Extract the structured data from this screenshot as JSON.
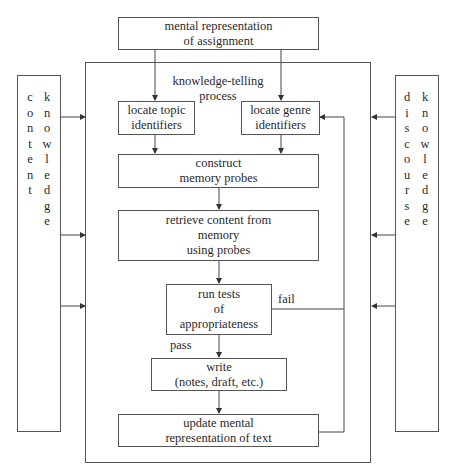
{
  "diagram": {
    "title_box": {
      "line1": "mental representation",
      "line2": "of assignment"
    },
    "process_label": {
      "line1": "knowledge-telling",
      "line2": "process"
    },
    "nodes": {
      "locate_topic": {
        "line1": "locate topic",
        "line2": "identifiers"
      },
      "locate_genre": {
        "line1": "locate genre",
        "line2": "identifiers"
      },
      "construct": {
        "line1": "construct",
        "line2": "memory probes"
      },
      "retrieve": {
        "line1": "retrieve content from",
        "line2": "memory",
        "line3": "using probes"
      },
      "run_tests": {
        "line1": "run tests",
        "line2": "of",
        "line3": "appropriateness"
      },
      "write": {
        "line1": "write",
        "line2": "(notes, draft, etc.)"
      },
      "update": {
        "line1": "update mental",
        "line2": "representation of text"
      }
    },
    "edge_labels": {
      "fail": "fail",
      "pass": "pass"
    },
    "left_side": {
      "col1": [
        "c",
        "o",
        "n",
        "t",
        "e",
        "n",
        "t"
      ],
      "col2": [
        "k",
        "n",
        "o",
        "w",
        "l",
        "e",
        "d",
        "g",
        "e"
      ]
    },
    "right_side": {
      "col1": [
        "d",
        "i",
        "s",
        "c",
        "o",
        "u",
        "r",
        "s",
        "e"
      ],
      "col2": [
        "k",
        "n",
        "o",
        "w",
        "l",
        "e",
        "d",
        "g",
        "e"
      ]
    }
  }
}
